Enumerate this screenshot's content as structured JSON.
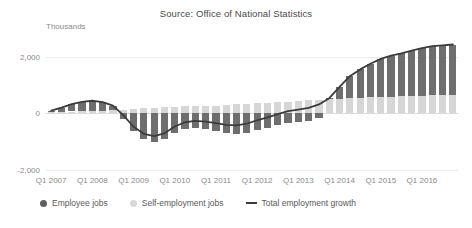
{
  "chart_title": "Source: Office of National Statistics",
  "unit_label": "Thousands",
  "legend": [
    {
      "label": "Employee jobs",
      "marker": "dot-icon",
      "color": "#5e5e5e"
    },
    {
      "label": "Self-employment jobs",
      "marker": "dot-icon",
      "color": "#d9d9d9"
    },
    {
      "label": "Total employment growth",
      "marker": "line-icon",
      "color": "#3c3c3c"
    }
  ],
  "chart_data": {
    "type": "bar",
    "title": "Source: Office of National Statistics",
    "subtitle": "",
    "xlabel": "",
    "ylabel": "Thousands",
    "ylim": [
      -2000,
      2600
    ],
    "yticks": [
      2000,
      0,
      -2000
    ],
    "ytick_labels": [
      "2,000",
      "0",
      "-2,000"
    ],
    "grid": true,
    "legend_position": "bottom-left",
    "stacked": true,
    "x": [
      "Q1 2007",
      "Q2 2007",
      "Q3 2007",
      "Q4 2007",
      "Q1 2008",
      "Q2 2008",
      "Q3 2008",
      "Q4 2008",
      "Q1 2009",
      "Q2 2009",
      "Q3 2009",
      "Q4 2009",
      "Q1 2010",
      "Q2 2010",
      "Q3 2010",
      "Q4 2010",
      "Q1 2011",
      "Q2 2011",
      "Q3 2011",
      "Q4 2011",
      "Q1 2012",
      "Q2 2012",
      "Q3 2012",
      "Q4 2012",
      "Q1 2013",
      "Q2 2013",
      "Q3 2013",
      "Q4 2013",
      "Q1 2014",
      "Q2 2014",
      "Q3 2014",
      "Q4 2014",
      "Q1 2015",
      "Q2 2015",
      "Q3 2015",
      "Q4 2015",
      "Q1 2016",
      "Q2 2016",
      "Q3 2016",
      "Q4 2016"
    ],
    "xtick_labels": [
      "Q1 2007",
      "Q1 2008",
      "Q1 2009",
      "Q1 2010",
      "Q1 2011",
      "Q1 2012",
      "Q1 2013",
      "Q1 2014",
      "Q1 2015",
      "Q1 2016"
    ],
    "xtick_indices": [
      0,
      4,
      8,
      12,
      16,
      20,
      24,
      28,
      32,
      36
    ],
    "series": [
      {
        "name": "Employee jobs",
        "color": "#6e6e6e",
        "values": [
          60,
          150,
          260,
          330,
          360,
          300,
          170,
          -180,
          -620,
          -900,
          -1000,
          -920,
          -700,
          -560,
          -520,
          -560,
          -620,
          -700,
          -740,
          -700,
          -600,
          -520,
          -420,
          -340,
          -300,
          -260,
          -160,
          40,
          420,
          780,
          1000,
          1180,
          1340,
          1450,
          1520,
          1600,
          1680,
          1740,
          1760,
          1780
        ]
      },
      {
        "name": "Self-employment jobs",
        "color": "#d6d6d6",
        "values": [
          40,
          60,
          70,
          80,
          90,
          100,
          110,
          120,
          150,
          180,
          200,
          220,
          240,
          250,
          260,
          270,
          280,
          300,
          320,
          340,
          360,
          380,
          400,
          420,
          440,
          460,
          480,
          500,
          520,
          540,
          560,
          580,
          590,
          600,
          610,
          620,
          630,
          640,
          650,
          660
        ]
      }
    ],
    "line_series": {
      "name": "Total employment growth",
      "color": "#3c3c3c",
      "values": [
        100,
        210,
        330,
        410,
        450,
        400,
        280,
        -60,
        -470,
        -720,
        -800,
        -700,
        -460,
        -310,
        -260,
        -290,
        -340,
        -400,
        -420,
        -360,
        -240,
        -140,
        -20,
        80,
        140,
        200,
        320,
        540,
        940,
        1320,
        1560,
        1760,
        1930,
        2050,
        2130,
        2220,
        2310,
        2380,
        2410,
        2440
      ]
    }
  }
}
